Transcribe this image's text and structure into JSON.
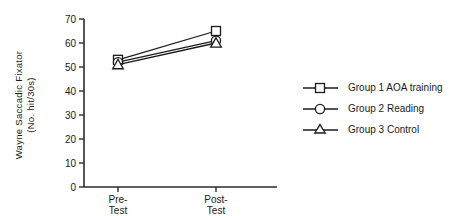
{
  "chart_data": {
    "type": "line",
    "title": "",
    "xlabel": "",
    "ylabel_line1": "Wayne  Saccadic  Fixator",
    "ylabel_line2": "(No. hit/30s)",
    "categories": [
      "Pre-Test",
      "Post-Test"
    ],
    "category_line1": [
      "Pre-",
      "Post-"
    ],
    "category_line2": [
      "Test",
      "Test"
    ],
    "ylim": [
      0,
      70
    ],
    "yticks": [
      0,
      10,
      20,
      30,
      40,
      50,
      60,
      70
    ],
    "ytick_labels": [
      "0",
      "10",
      "20",
      "30",
      "40",
      "50",
      "60",
      "70"
    ],
    "grid": false,
    "legend_position": "right",
    "series": [
      {
        "name": "Group 1 AOA training",
        "marker": "square",
        "values": [
          53,
          65
        ]
      },
      {
        "name": "Group 2 Reading",
        "marker": "circle",
        "values": [
          52,
          61
        ]
      },
      {
        "name": "Group 3 Control",
        "marker": "triangle",
        "values": [
          51,
          60
        ]
      }
    ]
  },
  "legend": {
    "items": [
      {
        "label": "Group 1 AOA training",
        "marker": "square-marker-icon"
      },
      {
        "label": "Group 2 Reading",
        "marker": "circle-marker-icon"
      },
      {
        "label": "Group 3 Control",
        "marker": "triangle-marker-icon"
      }
    ]
  },
  "colors": {
    "ink": "#1a1a1a",
    "axis": "#2b2b2b",
    "background": "#ffffff",
    "marker_fill": "#ffffff"
  }
}
